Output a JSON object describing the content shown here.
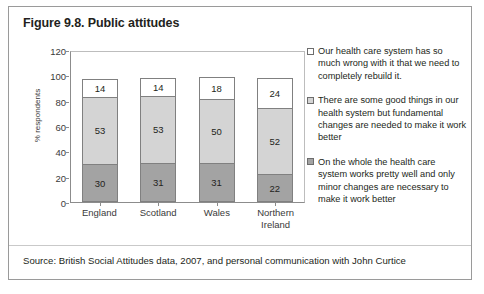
{
  "figure": {
    "title": "Figure 9.8. Public attitudes",
    "source": "Source: British Social Attitudes data, 2007, and personal communication with John Curtice"
  },
  "chart_data": {
    "type": "bar",
    "subtype": "stacked-column",
    "title": "Figure 9.8. Public attitudes",
    "xlabel": "",
    "ylabel": "% respondents",
    "ylim": [
      0,
      120
    ],
    "yticks": [
      0,
      20,
      40,
      60,
      80,
      100,
      120
    ],
    "grid": false,
    "legend_position": "right",
    "categories": [
      "England",
      "Scotland",
      "Wales",
      "Northern Ireland"
    ],
    "series": [
      {
        "name": "On the whole the health care system works pretty well and only minor changes are necessary to make it work better",
        "color": "#a3a3a3",
        "values": [
          30,
          31,
          31,
          22
        ]
      },
      {
        "name": "There are some good things in our health system but fundamental changes are needed to make it work better",
        "color": "#d4d4d4",
        "values": [
          53,
          53,
          50,
          52
        ]
      },
      {
        "name": "Our health care system has so much wrong with it that we need to completely rebuild it.",
        "color": "#ffffff",
        "values": [
          14,
          14,
          18,
          24
        ]
      }
    ]
  },
  "axis": {
    "y_title": "% respondents",
    "y_ticks": [
      "120",
      "100",
      "80",
      "60",
      "40",
      "20",
      "0"
    ],
    "x_labels": [
      {
        "line1": "England",
        "line2": ""
      },
      {
        "line1": "Scotland",
        "line2": ""
      },
      {
        "line1": "Wales",
        "line2": ""
      },
      {
        "line1": "Northern",
        "line2": "Ireland"
      }
    ]
  },
  "bars": [
    {
      "category": "England",
      "top": "14",
      "middle": "53",
      "bottom": "30"
    },
    {
      "category": "Scotland",
      "top": "14",
      "middle": "53",
      "bottom": "31"
    },
    {
      "category": "Wales",
      "top": "18",
      "middle": "50",
      "bottom": "31"
    },
    {
      "category": "Northern Ireland",
      "top": "24",
      "middle": "52",
      "bottom": "22"
    }
  ],
  "legend": {
    "items": [
      {
        "marker": "white-square",
        "text": "Our health care system has so much wrong with it that we need to completely rebuild it."
      },
      {
        "marker": "light-gray-square",
        "text": "There are some good things in our health system but fundamental changes are needed to make it work better"
      },
      {
        "marker": "medium-gray-square",
        "text": "On the whole the health care system works pretty well and only minor changes are necessary to make it work better"
      }
    ]
  }
}
